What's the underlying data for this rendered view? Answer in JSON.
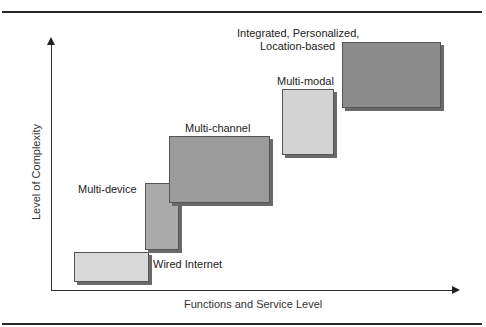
{
  "diagram": {
    "type": "staircase-block-diagram",
    "axes": {
      "y_label": "Level of Complexity",
      "x_label": "Functions and Service Level"
    },
    "stages": [
      {
        "id": "wired-internet",
        "label": "Wired Internet",
        "color": "#d9d9d9",
        "order": 1
      },
      {
        "id": "multi-device",
        "label": "Multi-device",
        "color": "#ababab",
        "order": 2
      },
      {
        "id": "multi-channel",
        "label": "Multi-channel",
        "color": "#9b9b9b",
        "order": 3
      },
      {
        "id": "multi-modal",
        "label": "Multi-modal",
        "color": "#d3d3d3",
        "order": 4
      },
      {
        "id": "integrated",
        "label_line1": "Integrated, Personalized,",
        "label_line2": "Location-based",
        "color": "#8c8c8c",
        "order": 5
      }
    ]
  }
}
